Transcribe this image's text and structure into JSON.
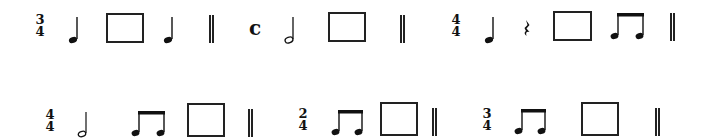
{
  "worksheet": {
    "rows": [
      {
        "measures": [
          {
            "time_signature": {
              "top": "3",
              "bottom": "4"
            },
            "items": [
              "quarter-note",
              "blank-box",
              "quarter-note"
            ],
            "end": "double-bar"
          },
          {
            "time_signature": {
              "symbol": "c"
            },
            "items": [
              "half-note",
              "blank-box"
            ],
            "end": "double-bar"
          },
          {
            "time_signature": {
              "top": "4",
              "bottom": "4"
            },
            "items": [
              "quarter-note",
              "quarter-rest",
              "blank-box",
              "beamed-eighth-notes"
            ],
            "end": "double-bar"
          }
        ]
      },
      {
        "measures": [
          {
            "time_signature": {
              "top": "4",
              "bottom": "4"
            },
            "items": [
              "half-note",
              "beamed-eighth-notes",
              "blank-box"
            ],
            "end": "double-bar"
          },
          {
            "time_signature": {
              "top": "2",
              "bottom": "4"
            },
            "items": [
              "beamed-eighth-notes",
              "blank-box"
            ],
            "end": "double-bar"
          },
          {
            "time_signature": {
              "top": "3",
              "bottom": "4"
            },
            "items": [
              "beamed-eighth-notes",
              "blank-box"
            ],
            "end": "double-bar"
          }
        ]
      }
    ]
  },
  "ts": {
    "r1m1_top": "3",
    "r1m1_bottom": "4",
    "r1m2_symbol": "c",
    "r1m3_top": "4",
    "r1m3_bottom": "4",
    "r2m1_top": "4",
    "r2m1_bottom": "4",
    "r2m2_top": "2",
    "r2m2_bottom": "4",
    "r2m3_top": "3",
    "r2m3_bottom": "4"
  },
  "colors": {
    "ink": "#111111",
    "background": "#ffffff"
  }
}
